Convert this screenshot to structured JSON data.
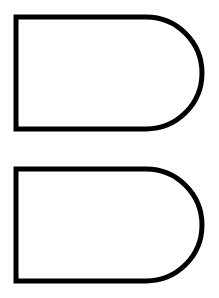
{
  "canvas": {
    "width": 219,
    "height": 298,
    "background_color": "#ffffff",
    "title": "Two D-shaped outlines"
  },
  "style": {
    "stroke_color": "#000000",
    "fill_color": "#ffffff",
    "stroke_width": 5
  },
  "shapes": [
    {
      "name": "d-shape-top",
      "label": "Top D shape",
      "left": 16,
      "top": 17,
      "right": 202,
      "bottom": 129,
      "width": 186,
      "height": 112,
      "corner_radius": 56,
      "straight_edge_end_x": 146,
      "path": "M 16 17 L 146 17 A 56 56 0 0 1 146 129 L 16 129 Z"
    },
    {
      "name": "d-shape-bottom",
      "label": "Bottom D shape",
      "left": 16,
      "top": 169,
      "right": 202,
      "bottom": 281,
      "width": 186,
      "height": 112,
      "corner_radius": 56,
      "straight_edge_end_x": 146,
      "path": "M 16 169 L 146 169 A 56 56 0 0 1 146 281 L 16 281 Z"
    }
  ]
}
